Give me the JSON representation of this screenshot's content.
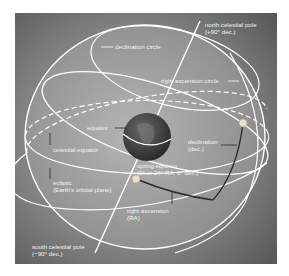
{
  "diagram": {
    "colors": {
      "background_dark": "#5a5a5a",
      "background_light": "#9a9a9a",
      "sphere_fill": "#b8b8b8",
      "lines": "#ffffff",
      "earth": "#3a3a3a",
      "arc": "#2a2a2a"
    },
    "labels": {
      "north_pole_line1": "north celestial pole",
      "north_pole_line2": "(+90° dec.)",
      "declination_circle": "declination circle",
      "right_ascension_circle": "right ascension circle",
      "equator": "equator",
      "celestial_equator": "celestial equator",
      "declination_line1": "declination",
      "declination_line2": "(dec.)",
      "spring_equinox_line1": "spring equinox",
      "spring_equinox_line2": "(0° or 24° RA, 0° dec.)",
      "ecliptic_line1": "ecliptic",
      "ecliptic_line2": "(Earth's orbital plane)",
      "right_ascension_line1": "right ascension",
      "right_ascension_line2": "(RA)",
      "south_pole_line1": "south celestial pole",
      "south_pole_line2": "(−90° dec.)"
    }
  }
}
